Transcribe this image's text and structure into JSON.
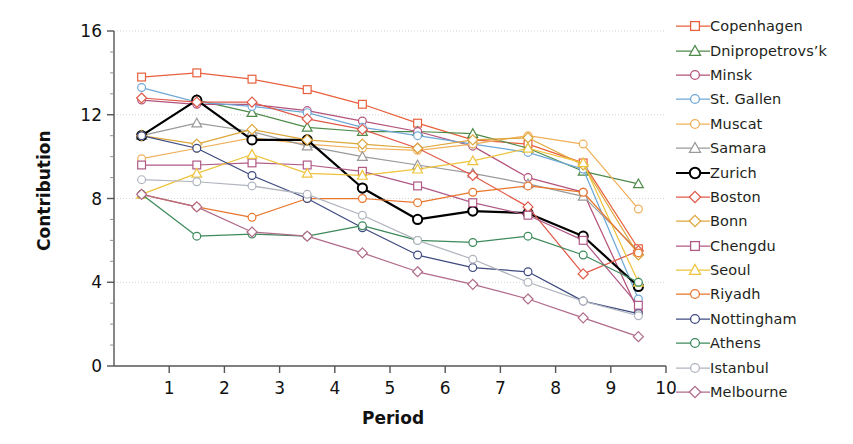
{
  "chart_data": {
    "type": "line",
    "title": "",
    "xlabel": "Period",
    "ylabel": "Contribution",
    "xlim": [
      0,
      10
    ],
    "ylim": [
      0,
      16
    ],
    "x": [
      0.5,
      1.5,
      2.5,
      3.5,
      4.5,
      5.5,
      6.5,
      7.5,
      8.5,
      9.5
    ],
    "xticks": [
      1,
      2,
      3,
      4,
      5,
      6,
      7,
      8,
      9,
      10
    ],
    "yticks": [
      0,
      4,
      8,
      12,
      16
    ],
    "grid": true,
    "legend_position": "right",
    "series": [
      {
        "name": "Copenhagen",
        "color": "#e8603c",
        "marker": "square",
        "values": [
          13.8,
          14.0,
          13.7,
          13.2,
          12.5,
          11.6,
          10.8,
          10.6,
          9.7,
          5.6
        ]
      },
      {
        "name": "Dnipropetrovs'k",
        "color": "#4e8a4a",
        "marker": "triangle",
        "values": [
          11.0,
          12.7,
          12.1,
          11.4,
          11.2,
          11.2,
          11.1,
          10.4,
          9.3,
          8.7
        ]
      },
      {
        "name": "Minsk",
        "color": "#b4537a",
        "marker": "circle",
        "values": [
          12.7,
          12.5,
          12.5,
          12.2,
          11.7,
          11.2,
          10.5,
          9.0,
          8.3,
          2.6
        ]
      },
      {
        "name": "St. Gallen",
        "color": "#6fa8d6",
        "marker": "circle",
        "values": [
          13.3,
          12.6,
          12.4,
          12.1,
          11.4,
          11.0,
          10.6,
          10.2,
          9.4,
          3.2
        ]
      },
      {
        "name": "Muscat",
        "color": "#f0b05a",
        "marker": "circle",
        "values": [
          9.9,
          10.4,
          10.9,
          10.6,
          10.4,
          10.3,
          10.6,
          11.0,
          10.6,
          7.5
        ]
      },
      {
        "name": "Samara",
        "color": "#9a9a9a",
        "marker": "triangle",
        "values": [
          11.0,
          11.6,
          11.2,
          10.5,
          10.0,
          9.6,
          9.2,
          8.7,
          8.1,
          5.5
        ]
      },
      {
        "name": "Zurich",
        "color": "#000000",
        "marker": "circle",
        "values": [
          11.0,
          12.7,
          10.8,
          10.8,
          8.5,
          7.0,
          7.4,
          7.3,
          6.2,
          3.8
        ]
      },
      {
        "name": "Boston",
        "color": "#e05a4a",
        "marker": "diamond",
        "values": [
          12.8,
          12.6,
          12.6,
          11.8,
          11.3,
          10.4,
          9.1,
          7.6,
          4.4,
          5.5
        ]
      },
      {
        "name": "Bonn",
        "color": "#dda73c",
        "marker": "diamond",
        "values": [
          11.0,
          10.6,
          11.3,
          10.8,
          10.6,
          10.4,
          10.8,
          10.9,
          9.6,
          5.3
        ]
      },
      {
        "name": "Chengdu",
        "color": "#b05a87",
        "marker": "square",
        "values": [
          9.6,
          9.6,
          9.7,
          9.6,
          9.3,
          8.6,
          7.8,
          7.2,
          6.0,
          2.9
        ]
      },
      {
        "name": "Seoul",
        "color": "#eec33c",
        "marker": "triangle",
        "values": [
          8.2,
          9.2,
          10.1,
          9.2,
          9.1,
          9.4,
          9.8,
          10.4,
          9.7,
          4.0
        ]
      },
      {
        "name": "Riyadh",
        "color": "#e8762c",
        "marker": "circle",
        "values": [
          8.2,
          7.6,
          7.1,
          8.0,
          8.0,
          7.8,
          8.3,
          8.6,
          8.3,
          5.4
        ]
      },
      {
        "name": "Nottingham",
        "color": "#3e4a80",
        "marker": "circle",
        "values": [
          11.0,
          10.4,
          9.1,
          8.0,
          6.6,
          5.3,
          4.7,
          4.5,
          3.1,
          2.5
        ]
      },
      {
        "name": "Athens",
        "color": "#3d8a5c",
        "marker": "circle",
        "values": [
          8.2,
          6.2,
          6.3,
          6.2,
          6.7,
          6.0,
          5.9,
          6.2,
          5.3,
          4.0
        ]
      },
      {
        "name": "Istanbul",
        "color": "#b0b4be",
        "marker": "circle",
        "values": [
          8.9,
          8.8,
          8.6,
          8.2,
          7.2,
          6.0,
          5.1,
          4.0,
          3.1,
          2.4
        ]
      },
      {
        "name": "Melbourne",
        "color": "#b06a8a",
        "marker": "diamond",
        "values": [
          8.2,
          7.6,
          6.4,
          6.2,
          5.4,
          4.5,
          3.9,
          3.2,
          2.3,
          1.4
        ]
      }
    ]
  },
  "axes": {
    "y_label": "Contribution",
    "x_label": "Period",
    "y_tick_labels": [
      "0",
      "4",
      "8",
      "12",
      "16"
    ],
    "x_tick_labels": [
      "1",
      "2",
      "3",
      "4",
      "5",
      "6",
      "7",
      "8",
      "9",
      "10"
    ]
  },
  "legend": {
    "items": [
      {
        "label": "Copenhagen",
        "color": "#e8603c",
        "marker": "square"
      },
      {
        "label": "Dnipropetrovs’k",
        "color": "#4e8a4a",
        "marker": "triangle"
      },
      {
        "label": "Minsk",
        "color": "#b4537a",
        "marker": "circle"
      },
      {
        "label": "St. Gallen",
        "color": "#6fa8d6",
        "marker": "circle"
      },
      {
        "label": "Muscat",
        "color": "#f0b05a",
        "marker": "circle"
      },
      {
        "label": "Samara",
        "color": "#9a9a9a",
        "marker": "triangle"
      },
      {
        "label": "Zurich",
        "color": "#000000",
        "marker": "circle"
      },
      {
        "label": "Boston",
        "color": "#e05a4a",
        "marker": "diamond"
      },
      {
        "label": "Bonn",
        "color": "#dda73c",
        "marker": "diamond"
      },
      {
        "label": "Chengdu",
        "color": "#b05a87",
        "marker": "square"
      },
      {
        "label": "Seoul",
        "color": "#eec33c",
        "marker": "triangle"
      },
      {
        "label": "Riyadh",
        "color": "#e8762c",
        "marker": "circle"
      },
      {
        "label": "Nottingham",
        "color": "#3e4a80",
        "marker": "circle"
      },
      {
        "label": "Athens",
        "color": "#3d8a5c",
        "marker": "circle"
      },
      {
        "label": "Istanbul",
        "color": "#b0b4be",
        "marker": "circle"
      },
      {
        "label": "Melbourne",
        "color": "#b06a8a",
        "marker": "diamond"
      }
    ]
  }
}
